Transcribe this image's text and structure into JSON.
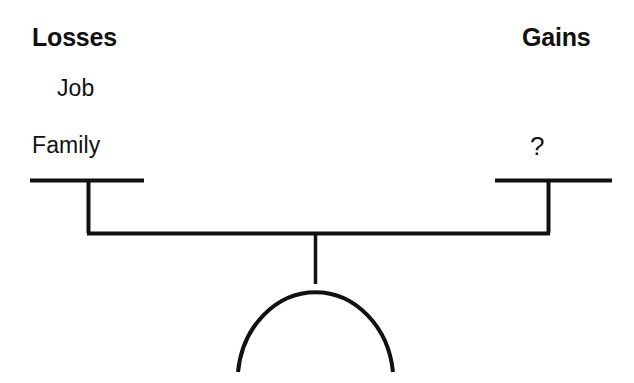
{
  "diagram": {
    "background_color": "#ffffff",
    "stroke_color": "#111111"
  },
  "headings": {
    "left": "Losses",
    "right": "Gains"
  },
  "left_pan_items": [
    {
      "label": "Job"
    },
    {
      "label": "Family"
    }
  ],
  "right_pan_items": [
    {
      "label": "?"
    }
  ],
  "scale": {
    "beam_label": "balance-beam",
    "left_pan_label": "left-pan",
    "right_pan_label": "right-pan",
    "fulcrum_label": "fulcrum",
    "base_label": "base-arc"
  }
}
